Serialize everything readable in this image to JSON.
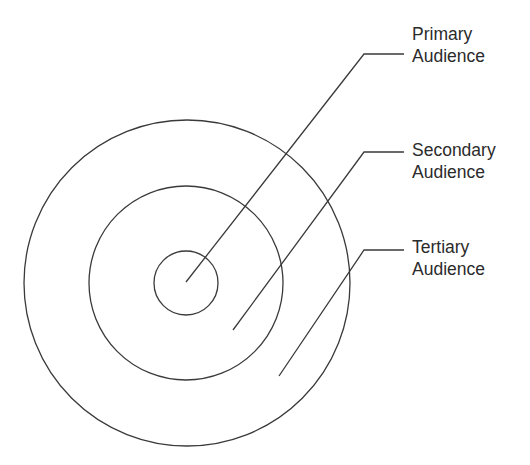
{
  "diagram": {
    "stroke_color": "#3a3a3a",
    "center": [
      186,
      283
    ],
    "rings": [
      {
        "name": "primary",
        "radius": 32
      },
      {
        "name": "secondary",
        "radius": 97
      },
      {
        "name": "tertiary",
        "radius": 163
      }
    ],
    "labels": [
      {
        "line1": "Primary",
        "line2": "Audience",
        "top": 23
      },
      {
        "line1": "Secondary",
        "line2": "Audience",
        "top": 139
      },
      {
        "line1": "Tertiary",
        "line2": "Audience",
        "top": 236
      }
    ],
    "leaders": [
      {
        "from": [
          186,
          282
        ],
        "knee": [
          364,
          54
        ],
        "to": [
          404,
          54
        ]
      },
      {
        "from": [
          233,
          330
        ],
        "knee": [
          364,
          152
        ],
        "to": [
          404,
          152
        ]
      },
      {
        "from": [
          279,
          376
        ],
        "knee": [
          364,
          250
        ],
        "to": [
          404,
          250
        ]
      }
    ]
  }
}
